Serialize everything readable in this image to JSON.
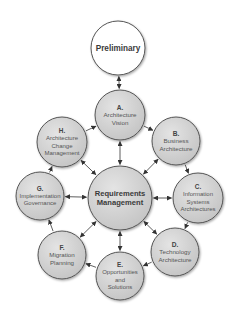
{
  "diagram": {
    "colors": {
      "background": "#ffffff",
      "phase_fill": "#d0d0d0",
      "phase_stroke": "#555555",
      "preliminary_fill": "#ffffff",
      "arrow": "#333333"
    },
    "nodes": [
      {
        "id": "preliminary",
        "letter": "",
        "lines": [
          "Preliminary"
        ],
        "cx": 118,
        "cy": 48,
        "r": 27,
        "style": "white",
        "font": 8.2,
        "bold": true
      },
      {
        "id": "A",
        "letter": "A.",
        "lines": [
          "Architecture",
          "Vision"
        ],
        "cx": 120,
        "cy": 115,
        "r": 25,
        "style": "grey",
        "font": 6.2,
        "bold": false
      },
      {
        "id": "B",
        "letter": "B.",
        "lines": [
          "Business",
          "Architecture"
        ],
        "cx": 176,
        "cy": 141,
        "r": 24,
        "style": "grey",
        "font": 6.2,
        "bold": false
      },
      {
        "id": "C",
        "letter": "C.",
        "lines": [
          "Information",
          "Systems",
          "Architectures"
        ],
        "cx": 198,
        "cy": 198,
        "r": 25,
        "style": "grey",
        "font": 6.0,
        "bold": false
      },
      {
        "id": "D",
        "letter": "D.",
        "lines": [
          "Technology",
          "Architecture"
        ],
        "cx": 175,
        "cy": 252,
        "r": 24,
        "style": "grey",
        "font": 6.2,
        "bold": false
      },
      {
        "id": "E",
        "letter": "E.",
        "lines": [
          "Opportunities",
          "and",
          "Solutions"
        ],
        "cx": 120,
        "cy": 276,
        "r": 24,
        "style": "grey",
        "font": 6.0,
        "bold": false
      },
      {
        "id": "F",
        "letter": "F.",
        "lines": [
          "Migration",
          "Planning"
        ],
        "cx": 62,
        "cy": 255,
        "r": 24,
        "style": "grey",
        "font": 6.2,
        "bold": false
      },
      {
        "id": "G",
        "letter": "G.",
        "lines": [
          "Implementation",
          "Governance"
        ],
        "cx": 40,
        "cy": 196,
        "r": 24,
        "style": "grey",
        "font": 6.0,
        "bold": false
      },
      {
        "id": "H",
        "letter": "H.",
        "lines": [
          "Architecture",
          "Change",
          "Management"
        ],
        "cx": 62,
        "cy": 142,
        "r": 25,
        "style": "grey",
        "font": 6.0,
        "bold": false
      },
      {
        "id": "RM",
        "letter": "",
        "lines": [
          "Requirements",
          "Management"
        ],
        "cx": 120,
        "cy": 198,
        "r": 32,
        "style": "grey",
        "font": 7.6,
        "bold": true
      }
    ],
    "cycle_edges": [
      {
        "from": "A",
        "to": "B",
        "type": "single"
      },
      {
        "from": "B",
        "to": "C",
        "type": "single"
      },
      {
        "from": "C",
        "to": "D",
        "type": "single"
      },
      {
        "from": "D",
        "to": "E",
        "type": "single"
      },
      {
        "from": "E",
        "to": "F",
        "type": "single"
      },
      {
        "from": "F",
        "to": "G",
        "type": "single"
      },
      {
        "from": "G",
        "to": "H",
        "type": "single"
      },
      {
        "from": "H",
        "to": "A",
        "type": "single"
      }
    ],
    "spoke_edges": [
      {
        "from": "preliminary",
        "to": "A",
        "type": "double"
      },
      {
        "from": "RM",
        "to": "A",
        "type": "double"
      },
      {
        "from": "RM",
        "to": "B",
        "type": "double"
      },
      {
        "from": "RM",
        "to": "C",
        "type": "double"
      },
      {
        "from": "RM",
        "to": "D",
        "type": "double"
      },
      {
        "from": "RM",
        "to": "E",
        "type": "double"
      },
      {
        "from": "RM",
        "to": "F",
        "type": "double"
      },
      {
        "from": "RM",
        "to": "G",
        "type": "double"
      },
      {
        "from": "RM",
        "to": "H",
        "type": "double"
      }
    ]
  }
}
